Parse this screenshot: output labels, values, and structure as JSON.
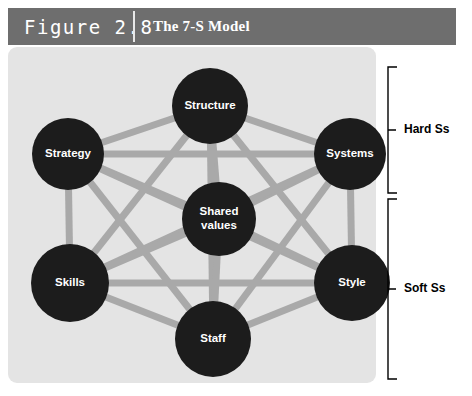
{
  "header": {
    "figure_number": "Figure 2.8",
    "title": "The 7-S Model"
  },
  "diagram": {
    "type": "network",
    "node_color": "#1c1c1c",
    "node_text_color": "#ffffff",
    "edge_color": "#a9a9a9",
    "panel_color": "#e4e4e4",
    "header_color": "#6e6e6e",
    "nodes": [
      {
        "id": "structure",
        "label": "Structure",
        "cx": 202,
        "cy": 59,
        "r": 38,
        "group": "hard"
      },
      {
        "id": "strategy",
        "label": "Strategy",
        "cx": 60,
        "cy": 107,
        "r": 36,
        "group": "hard"
      },
      {
        "id": "systems",
        "label": "Systems",
        "cx": 342,
        "cy": 107,
        "r": 36,
        "group": "hard"
      },
      {
        "id": "shared-values",
        "label": "Shared\nvalues",
        "cx": 211,
        "cy": 172,
        "r": 37,
        "group": "center"
      },
      {
        "id": "skills",
        "label": "Skills",
        "cx": 62,
        "cy": 236,
        "r": 39,
        "group": "soft"
      },
      {
        "id": "style",
        "label": "Style",
        "cx": 344,
        "cy": 236,
        "r": 38,
        "group": "soft"
      },
      {
        "id": "staff",
        "label": "Staff",
        "cx": 205,
        "cy": 292,
        "r": 38,
        "group": "soft"
      }
    ],
    "edges": [
      [
        "structure",
        "strategy"
      ],
      [
        "structure",
        "systems"
      ],
      [
        "structure",
        "shared-values"
      ],
      [
        "structure",
        "skills"
      ],
      [
        "structure",
        "style"
      ],
      [
        "structure",
        "staff"
      ],
      [
        "strategy",
        "systems"
      ],
      [
        "strategy",
        "shared-values"
      ],
      [
        "strategy",
        "skills"
      ],
      [
        "strategy",
        "style"
      ],
      [
        "strategy",
        "staff"
      ],
      [
        "systems",
        "shared-values"
      ],
      [
        "systems",
        "skills"
      ],
      [
        "systems",
        "style"
      ],
      [
        "systems",
        "staff"
      ],
      [
        "shared-values",
        "skills"
      ],
      [
        "shared-values",
        "style"
      ],
      [
        "shared-values",
        "staff"
      ],
      [
        "skills",
        "style"
      ],
      [
        "skills",
        "staff"
      ],
      [
        "style",
        "staff"
      ]
    ],
    "brackets": [
      {
        "id": "hard-ss",
        "label": "Hard Ss",
        "top": 20,
        "bottom": 146,
        "x": 380,
        "label_x": 396,
        "label_y": 83
      },
      {
        "id": "soft-ss",
        "label": "Soft Ss",
        "top": 152,
        "bottom": 332,
        "x": 380,
        "label_x": 396,
        "label_y": 242
      }
    ]
  }
}
